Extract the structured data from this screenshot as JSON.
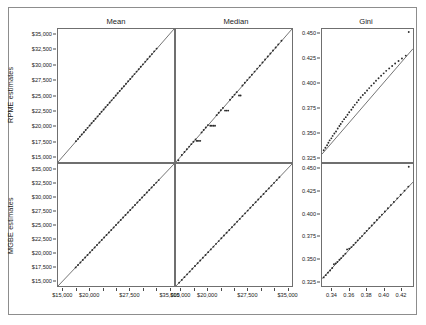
{
  "figure": {
    "rows": [
      {
        "key": "rpme",
        "label": "RPME estimates"
      },
      {
        "key": "mgbe",
        "label": "MGBE estimates"
      }
    ],
    "columns": [
      {
        "key": "mean",
        "label": "Mean"
      },
      {
        "key": "median",
        "label": "Median"
      },
      {
        "key": "gini",
        "label": "Gini"
      }
    ]
  },
  "axes": {
    "money_ticks": [
      "$15,000",
      "$17,500",
      "$20,000",
      "$22,500",
      "$25,000",
      "$27,500",
      "$30,000",
      "$32,500",
      "$35,000"
    ],
    "money_y_labels": [
      "$35,000",
      "$32,500",
      "$30,000",
      "$27,500",
      "$25,000",
      "$22,500",
      "$20,000",
      "$17,500",
      "$15,000"
    ],
    "money_x_labels": [
      "$15,000",
      "",
      "$20,000",
      "",
      "",
      "$27,500",
      "",
      "",
      "$35,000"
    ],
    "gini_y_labels": [
      "0.450",
      "0.425",
      "0.400",
      "0.375",
      "0.350",
      "0.325"
    ],
    "gini_x_labels": [
      "0.34",
      "0.36",
      "0.38",
      "0.40",
      "0.42"
    ],
    "money_range": [
      14000,
      36000
    ],
    "gini_range": [
      0.32,
      0.455
    ],
    "gini_x_range": [
      0.328,
      0.435
    ]
  },
  "chart_data": {
    "type": "scatter",
    "title": "",
    "layout": "2x3 scatter plot matrix with 1:1 reference line in each panel",
    "grid": false,
    "legend": null,
    "row_labels": [
      "RPME estimates",
      "MGBE estimates"
    ],
    "column_labels": [
      "Mean",
      "Median",
      "Gini"
    ],
    "panels": [
      {
        "row": "RPME estimates",
        "column": "Mean",
        "xlabel": "",
        "ylabel": "RPME estimates",
        "xlim": [
          14000,
          36000
        ],
        "ylim": [
          14000,
          36000
        ],
        "reference_line": "y = x",
        "points": [
          [
            17400,
            17450
          ],
          [
            17800,
            17820
          ],
          [
            18150,
            18200
          ],
          [
            18500,
            18560
          ],
          [
            18900,
            18930
          ],
          [
            19250,
            19300
          ],
          [
            19600,
            19650
          ],
          [
            20000,
            20050
          ],
          [
            20350,
            20400
          ],
          [
            20750,
            20790
          ],
          [
            21100,
            21150
          ],
          [
            21500,
            21540
          ],
          [
            21900,
            21930
          ],
          [
            22250,
            22300
          ],
          [
            22650,
            22680
          ],
          [
            23000,
            23060
          ],
          [
            23400,
            23440
          ],
          [
            23800,
            23830
          ],
          [
            24150,
            24200
          ],
          [
            24550,
            24590
          ],
          [
            24950,
            25000
          ],
          [
            25300,
            25360
          ],
          [
            25700,
            25740
          ],
          [
            26100,
            26150
          ],
          [
            26500,
            26540
          ],
          [
            26900,
            26940
          ],
          [
            27300,
            27350
          ],
          [
            27700,
            27740
          ],
          [
            28100,
            28150
          ],
          [
            28500,
            28540
          ],
          [
            28900,
            28950
          ],
          [
            29300,
            29340
          ],
          [
            29700,
            29750
          ],
          [
            30100,
            30150
          ],
          [
            30550,
            30600
          ],
          [
            30950,
            31000
          ],
          [
            31400,
            31450
          ],
          [
            31800,
            31850
          ],
          [
            32250,
            32300
          ],
          [
            32700,
            32760
          ]
        ]
      },
      {
        "row": "RPME estimates",
        "column": "Median",
        "xlabel": "",
        "ylabel": "RPME estimates",
        "xlim": [
          14000,
          36000
        ],
        "ylim": [
          14000,
          36000
        ],
        "reference_line": "y = x",
        "points": [
          [
            14450,
            14300
          ],
          [
            15100,
            15150
          ],
          [
            15600,
            15650
          ],
          [
            16050,
            16100
          ],
          [
            16500,
            16550
          ],
          [
            16900,
            16950
          ],
          [
            17300,
            17350
          ],
          [
            17700,
            17750
          ],
          [
            17900,
            17500
          ],
          [
            18100,
            17500
          ],
          [
            18350,
            17500
          ],
          [
            18600,
            17500
          ],
          [
            18850,
            18900
          ],
          [
            19250,
            19300
          ],
          [
            19650,
            19700
          ],
          [
            20050,
            20100
          ],
          [
            20500,
            20000
          ],
          [
            20800,
            20000
          ],
          [
            21100,
            20000
          ],
          [
            21400,
            20000
          ],
          [
            21700,
            21750
          ],
          [
            22100,
            22150
          ],
          [
            22500,
            22550
          ],
          [
            22900,
            22950
          ],
          [
            23300,
            22500
          ],
          [
            23600,
            22500
          ],
          [
            23900,
            22500
          ],
          [
            24250,
            24300
          ],
          [
            24700,
            24750
          ],
          [
            25100,
            25150
          ],
          [
            25500,
            25550
          ],
          [
            25950,
            25000
          ],
          [
            26250,
            25000
          ],
          [
            26600,
            26650
          ],
          [
            27050,
            27100
          ],
          [
            27500,
            27550
          ],
          [
            27950,
            28000
          ],
          [
            28400,
            28450
          ],
          [
            28900,
            28950
          ],
          [
            29400,
            29450
          ],
          [
            29900,
            29950
          ],
          [
            30400,
            30450
          ],
          [
            30900,
            30950
          ],
          [
            31400,
            31450
          ],
          [
            31900,
            31950
          ],
          [
            32400,
            32450
          ],
          [
            32900,
            32950
          ],
          [
            33400,
            33450
          ],
          [
            34000,
            34050
          ]
        ]
      },
      {
        "row": "RPME estimates",
        "column": "Gini",
        "xlabel": "",
        "ylabel": "RPME estimates",
        "xlim": [
          0.328,
          0.435
        ],
        "ylim": [
          0.32,
          0.455
        ],
        "reference_line": "y = x",
        "points": [
          [
            0.33,
            0.332
          ],
          [
            0.332,
            0.3345
          ],
          [
            0.334,
            0.337
          ],
          [
            0.3355,
            0.3395
          ],
          [
            0.337,
            0.342
          ],
          [
            0.339,
            0.344
          ],
          [
            0.3405,
            0.3465
          ],
          [
            0.3425,
            0.349
          ],
          [
            0.3445,
            0.351
          ],
          [
            0.3465,
            0.354
          ],
          [
            0.3485,
            0.3565
          ],
          [
            0.35,
            0.3585
          ],
          [
            0.352,
            0.361
          ],
          [
            0.354,
            0.3635
          ],
          [
            0.356,
            0.3655
          ],
          [
            0.358,
            0.368
          ],
          [
            0.36,
            0.3705
          ],
          [
            0.3625,
            0.373
          ],
          [
            0.3645,
            0.3755
          ],
          [
            0.3665,
            0.378
          ],
          [
            0.369,
            0.3805
          ],
          [
            0.371,
            0.383
          ],
          [
            0.3735,
            0.3855
          ],
          [
            0.376,
            0.388
          ],
          [
            0.3785,
            0.39
          ],
          [
            0.381,
            0.3925
          ],
          [
            0.3835,
            0.395
          ],
          [
            0.386,
            0.3975
          ],
          [
            0.389,
            0.4
          ],
          [
            0.3915,
            0.4025
          ],
          [
            0.3945,
            0.405
          ],
          [
            0.3975,
            0.4075
          ],
          [
            0.4005,
            0.41
          ],
          [
            0.4035,
            0.4125
          ],
          [
            0.407,
            0.415
          ],
          [
            0.4105,
            0.4175
          ],
          [
            0.414,
            0.42
          ],
          [
            0.418,
            0.4225
          ],
          [
            0.422,
            0.425
          ],
          [
            0.4265,
            0.428
          ],
          [
            0.43,
            0.452
          ]
        ]
      },
      {
        "row": "MGBE estimates",
        "column": "Mean",
        "xlabel": "$ value",
        "ylabel": "MGBE estimates",
        "xlim": [
          14000,
          36000
        ],
        "ylim": [
          14000,
          36000
        ],
        "reference_line": "y = x",
        "points": [
          [
            17350,
            17350
          ],
          [
            17800,
            17800
          ],
          [
            18250,
            18250
          ],
          [
            18700,
            18700
          ],
          [
            19150,
            19150
          ],
          [
            19600,
            19600
          ],
          [
            20050,
            20050
          ],
          [
            20500,
            20500
          ],
          [
            20950,
            20950
          ],
          [
            21400,
            21400
          ],
          [
            21850,
            21850
          ],
          [
            22300,
            22300
          ],
          [
            22750,
            22750
          ],
          [
            23200,
            23200
          ],
          [
            23650,
            23650
          ],
          [
            24100,
            24100
          ],
          [
            24550,
            24550
          ],
          [
            25000,
            25000
          ],
          [
            25450,
            25450
          ],
          [
            25900,
            25900
          ],
          [
            26350,
            26350
          ],
          [
            26800,
            26800
          ],
          [
            27250,
            27250
          ],
          [
            27700,
            27700
          ],
          [
            28150,
            28150
          ],
          [
            28600,
            28600
          ],
          [
            29050,
            29050
          ],
          [
            29500,
            29500
          ],
          [
            29950,
            29950
          ],
          [
            30400,
            30400
          ],
          [
            30850,
            30850
          ],
          [
            31300,
            31300
          ],
          [
            31750,
            31750
          ],
          [
            32200,
            32200
          ],
          [
            32650,
            32650
          ],
          [
            33100,
            33100
          ]
        ]
      },
      {
        "row": "MGBE estimates",
        "column": "Median",
        "xlabel": "$ value",
        "ylabel": "MGBE estimates",
        "xlim": [
          14000,
          36000
        ],
        "ylim": [
          14000,
          36000
        ],
        "reference_line": "y = x",
        "points": [
          [
            14600,
            14600
          ],
          [
            15100,
            15100
          ],
          [
            15600,
            15600
          ],
          [
            16100,
            16100
          ],
          [
            16600,
            16600
          ],
          [
            17100,
            17100
          ],
          [
            17600,
            17600
          ],
          [
            18100,
            18100
          ],
          [
            18600,
            18600
          ],
          [
            19100,
            19100
          ],
          [
            19600,
            19600
          ],
          [
            20100,
            20100
          ],
          [
            20600,
            20600
          ],
          [
            21100,
            21100
          ],
          [
            21600,
            21600
          ],
          [
            22100,
            22100
          ],
          [
            22600,
            22600
          ],
          [
            23100,
            23100
          ],
          [
            23600,
            23600
          ],
          [
            24100,
            24100
          ],
          [
            24600,
            24600
          ],
          [
            25100,
            25100
          ],
          [
            25600,
            25600
          ],
          [
            26100,
            26100
          ],
          [
            26600,
            26600
          ],
          [
            27100,
            27100
          ],
          [
            27600,
            27600
          ],
          [
            28100,
            28100
          ],
          [
            28600,
            28600
          ],
          [
            29100,
            29100
          ],
          [
            29600,
            29600
          ],
          [
            30100,
            30100
          ],
          [
            30600,
            30600
          ],
          [
            31100,
            31100
          ],
          [
            31600,
            31600
          ],
          [
            32100,
            32100
          ],
          [
            32600,
            32600
          ],
          [
            33100,
            33100
          ],
          [
            33600,
            33600
          ]
        ]
      },
      {
        "row": "MGBE estimates",
        "column": "Gini",
        "xlabel": "Gini coefficient",
        "ylabel": "MGBE estimates",
        "xlim": [
          0.328,
          0.435
        ],
        "ylim": [
          0.32,
          0.455
        ],
        "reference_line": "y = x",
        "points": [
          [
            0.33,
            0.3295
          ],
          [
            0.3325,
            0.332
          ],
          [
            0.335,
            0.3348
          ],
          [
            0.3375,
            0.3372
          ],
          [
            0.34,
            0.34
          ],
          [
            0.342,
            0.344
          ],
          [
            0.344,
            0.345
          ],
          [
            0.346,
            0.3465
          ],
          [
            0.3485,
            0.349
          ],
          [
            0.3505,
            0.3508
          ],
          [
            0.353,
            0.3535
          ],
          [
            0.3555,
            0.3558
          ],
          [
            0.3575,
            0.3605
          ],
          [
            0.36,
            0.3612
          ],
          [
            0.3625,
            0.363
          ],
          [
            0.365,
            0.3655
          ],
          [
            0.3675,
            0.368
          ],
          [
            0.37,
            0.3705
          ],
          [
            0.3725,
            0.373
          ],
          [
            0.375,
            0.3752
          ],
          [
            0.378,
            0.3785
          ],
          [
            0.3805,
            0.381
          ],
          [
            0.3835,
            0.384
          ],
          [
            0.3865,
            0.387
          ],
          [
            0.3895,
            0.39
          ],
          [
            0.3925,
            0.393
          ],
          [
            0.3955,
            0.396
          ],
          [
            0.3985,
            0.399
          ],
          [
            0.402,
            0.4025
          ],
          [
            0.4055,
            0.406
          ],
          [
            0.409,
            0.4095
          ],
          [
            0.4125,
            0.413
          ],
          [
            0.4165,
            0.417
          ],
          [
            0.4205,
            0.421
          ],
          [
            0.425,
            0.4255
          ],
          [
            0.4295,
            0.43
          ],
          [
            0.43,
            0.452
          ]
        ]
      }
    ]
  }
}
